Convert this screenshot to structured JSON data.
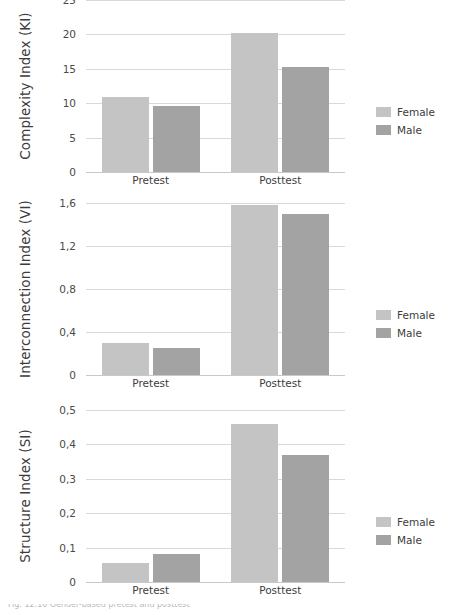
{
  "figure": {
    "caption_partial": "Fig. 12.10  Gender-based pretest and posttest",
    "legend": {
      "female_label": "Female",
      "male_label": "Male"
    },
    "colors": {
      "female": "#c4c4c4",
      "male": "#a3a3a3",
      "grid": "#d9d9d9",
      "text": "#3c3c3c"
    }
  },
  "chart_data": [
    {
      "type": "bar",
      "title": "",
      "ylabel": "Complexity Index (KI)",
      "xlabel": "",
      "categories": [
        "Pretest",
        "Posttest"
      ],
      "series": [
        {
          "name": "Female",
          "values": [
            10.9,
            20.2
          ]
        },
        {
          "name": "Male",
          "values": [
            9.6,
            15.2
          ]
        }
      ],
      "yticks": [
        0,
        5,
        10,
        15,
        20,
        25
      ],
      "ytick_labels": [
        "0",
        "5",
        "10",
        "15",
        "20",
        "25"
      ],
      "ylim": [
        0,
        25
      ],
      "grid": true,
      "legend_position": "right"
    },
    {
      "type": "bar",
      "title": "",
      "ylabel": "Interconnection Index (VI)",
      "xlabel": "",
      "categories": [
        "Pretest",
        "Posttest"
      ],
      "series": [
        {
          "name": "Female",
          "values": [
            0.3,
            1.58
          ]
        },
        {
          "name": "Male",
          "values": [
            0.25,
            1.5
          ]
        }
      ],
      "yticks": [
        0,
        0.4,
        0.8,
        1.2,
        1.6
      ],
      "ytick_labels": [
        "0",
        "0,4",
        "0,8",
        "1,2",
        "1,6"
      ],
      "ylim": [
        0,
        1.6
      ],
      "grid": true,
      "legend_position": "right"
    },
    {
      "type": "bar",
      "title": "",
      "ylabel": "Structure Index (SI)",
      "xlabel": "",
      "categories": [
        "Pretest",
        "Posttest"
      ],
      "series": [
        {
          "name": "Female",
          "values": [
            0.055,
            0.46
          ]
        },
        {
          "name": "Male",
          "values": [
            0.08,
            0.37
          ]
        }
      ],
      "yticks": [
        0,
        0.1,
        0.2,
        0.3,
        0.4,
        0.5
      ],
      "ytick_labels": [
        "0",
        "0,1",
        "0,2",
        "0,3",
        "0,4",
        "0,5"
      ],
      "ylim": [
        0,
        0.5
      ],
      "grid": true,
      "legend_position": "right"
    }
  ]
}
